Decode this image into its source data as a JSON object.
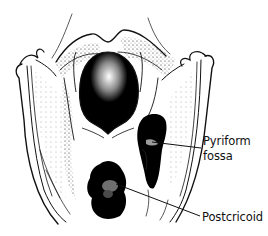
{
  "figure": {
    "labels": {
      "pyriform_line1": "Pyriform",
      "pyriform_line2": "fossa",
      "postcricoid": "Postcricoid"
    },
    "colors": {
      "ink": "#111111",
      "shade": "#000000",
      "background": "#ffffff"
    }
  }
}
